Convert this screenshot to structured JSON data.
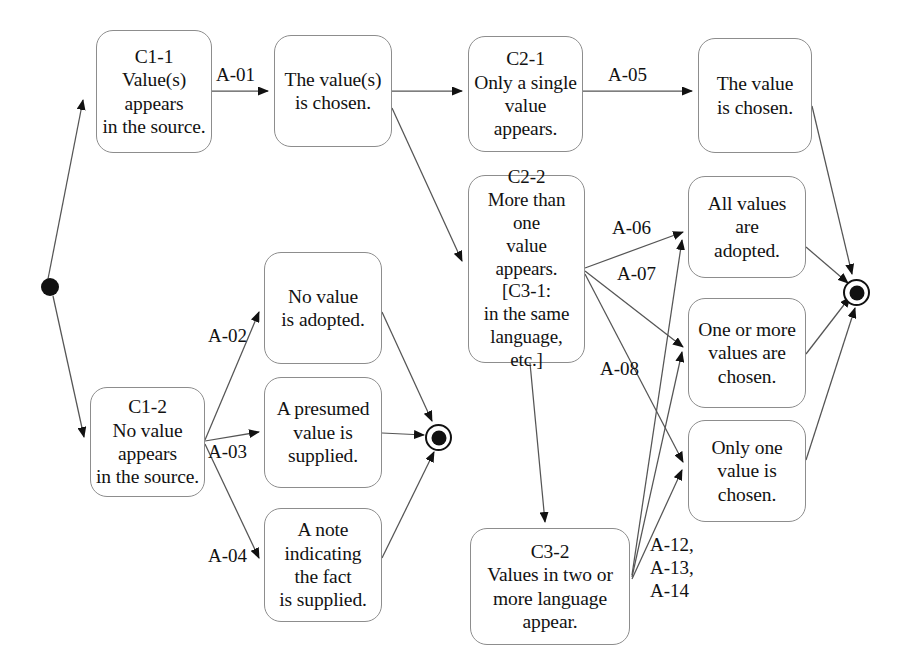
{
  "diagram": {
    "background_color": "#ffffff",
    "line_color": "#555555",
    "text_color": "#121212"
  },
  "nodes": {
    "c1_1": "C1-1\nValue(s)\nappears\nin the source.",
    "value_chosen_s": "The value(s)\nis chosen.",
    "c2_1": "C2-1\nOnly a single\nvalue\nappears.",
    "the_value_is_chosen": "The value\nis chosen.",
    "c2_2": "C2-2\nMore than one\nvalue\nappears.\n[C3-1:\nin the same\nlanguage, etc.]",
    "all_values_adopted": "All values\nare\nadopted.",
    "one_or_more_chosen": "One or more\nvalues are\nchosen.",
    "only_one_chosen": "Only one\nvalue is\nchosen.",
    "no_value_adopted": "No value\nis adopted.",
    "presumed_value": "A presumed\nvalue is\nsupplied.",
    "note_indicating": "A note\nindicating\nthe fact\nis supplied.",
    "c1_2": "C1-2\nNo value\nappears\nin the source.",
    "c3_2": "C3-2\nValues in two or\nmore language\nappear."
  },
  "edge_labels": {
    "a01": "A-01",
    "a05": "A-05",
    "a02": "A-02",
    "a03": "A-03",
    "a04": "A-04",
    "a06": "A-06",
    "a07": "A-07",
    "a08": "A-08",
    "a12_14": "A-12,\nA-13,\nA-14"
  },
  "states": {
    "initial_label": "initial-state",
    "final_left_label": "final-state-left",
    "final_right_label": "final-state-right"
  }
}
